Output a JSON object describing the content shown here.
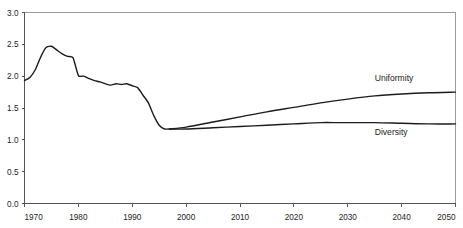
{
  "chart_data": {
    "type": "line",
    "title": "",
    "xlabel": "",
    "ylabel": "",
    "xlim": [
      1970,
      2050
    ],
    "ylim": [
      0.0,
      3.0
    ],
    "grid": false,
    "legend_position": "inline-right",
    "x_ticks": [
      "1970",
      "1980",
      "1990",
      "2000",
      "2010",
      "2020",
      "2030",
      "2040",
      "2050"
    ],
    "x_tick_values": [
      1970,
      1980,
      1990,
      2000,
      2010,
      2020,
      2030,
      2040,
      2050
    ],
    "y_ticks": [
      "0.0",
      "0.5",
      "1.0",
      "1.5",
      "2.0",
      "2.5",
      "3.0"
    ],
    "y_tick_values": [
      0.0,
      0.5,
      1.0,
      1.5,
      2.0,
      2.5,
      3.0
    ],
    "annotations": [
      {
        "text": "Uniformity",
        "x": 2035,
        "y": 1.93
      },
      {
        "text": "Diversity",
        "x": 2035,
        "y": 1.07
      }
    ],
    "series": [
      {
        "name": "Historical",
        "x": [
          1970,
          1971,
          1972,
          1973,
          1974,
          1975,
          1976,
          1977,
          1978,
          1979,
          1980,
          1981,
          1982,
          1983,
          1984,
          1985,
          1986,
          1987,
          1988,
          1989,
          1990,
          1991,
          1992,
          1993,
          1994,
          1995,
          1996,
          1997
        ],
        "values": [
          1.93,
          1.98,
          2.1,
          2.3,
          2.45,
          2.47,
          2.41,
          2.35,
          2.31,
          2.29,
          2.01,
          2.0,
          1.96,
          1.93,
          1.91,
          1.88,
          1.86,
          1.88,
          1.87,
          1.88,
          1.85,
          1.82,
          1.7,
          1.58,
          1.38,
          1.23,
          1.17,
          1.17
        ]
      },
      {
        "name": "Uniformity",
        "x": [
          1997,
          2000,
          2005,
          2010,
          2015,
          2020,
          2025,
          2030,
          2035,
          2040,
          2045,
          2050
        ],
        "values": [
          1.17,
          1.2,
          1.28,
          1.36,
          1.44,
          1.51,
          1.58,
          1.64,
          1.69,
          1.72,
          1.74,
          1.75
        ]
      },
      {
        "name": "Diversity",
        "x": [
          1997,
          2000,
          2005,
          2010,
          2015,
          2020,
          2025,
          2028,
          2030,
          2035,
          2040,
          2045,
          2050
        ],
        "values": [
          1.17,
          1.17,
          1.19,
          1.21,
          1.23,
          1.25,
          1.27,
          1.27,
          1.27,
          1.27,
          1.26,
          1.25,
          1.25
        ]
      }
    ]
  }
}
